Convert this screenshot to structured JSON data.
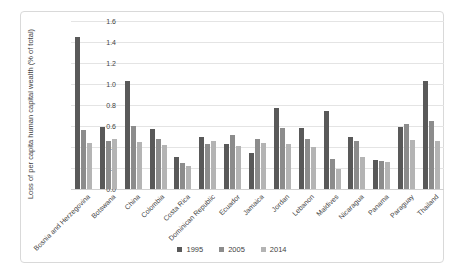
{
  "chart_data": {
    "type": "bar",
    "title": "",
    "xlabel": "",
    "ylabel": "Loss of per capita human capital wealth (% of total)",
    "ylim": [
      0,
      1.6
    ],
    "ytick_step": 0.2,
    "grid": true,
    "legend_position": "bottom-center",
    "categories": [
      "Bosnia and Herzegovina",
      "Botswana",
      "China",
      "Colombia",
      "Costa Rica",
      "Dominican Republic",
      "Ecuador",
      "Jamaica",
      "Jordan",
      "Lebanon",
      "Maldives",
      "Nicaragua",
      "Panama",
      "Paraguay",
      "Thailand"
    ],
    "series": [
      {
        "name": "1995",
        "color": "#595959",
        "values": [
          1.45,
          0.59,
          1.03,
          0.57,
          0.31,
          0.5,
          0.43,
          0.34,
          0.77,
          0.58,
          0.74,
          0.5,
          0.28,
          0.59,
          1.03
        ]
      },
      {
        "name": "2005",
        "color": "#8c8c8c",
        "values": [
          0.56,
          0.46,
          0.6,
          0.48,
          0.25,
          0.43,
          0.51,
          0.48,
          0.58,
          0.48,
          0.29,
          0.46,
          0.27,
          0.62,
          0.65
        ]
      },
      {
        "name": "2014",
        "color": "#b4b4b4",
        "values": [
          0.44,
          0.48,
          0.45,
          0.42,
          0.22,
          0.46,
          0.41,
          0.44,
          0.43,
          0.4,
          0.19,
          0.31,
          0.26,
          0.47,
          0.46
        ]
      }
    ],
    "colors": {
      "grid": "#e4e4e4",
      "frame": "#d9d9d9",
      "text": "#3f3f3f"
    }
  }
}
